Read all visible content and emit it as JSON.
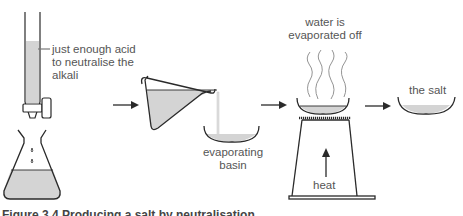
{
  "diagram": {
    "labels": {
      "burette": "just enough acid\nto neutralise the\nalkali",
      "burette_line1": "just enough acid",
      "burette_line2": "to neutralise the",
      "burette_line3": "alkali",
      "basin_line1": "evaporating",
      "basin_line2": "basin",
      "evap_line1": "water is",
      "evap_line2": "evaporated off",
      "heat": "heat",
      "salt": "the salt"
    },
    "caption": "Figure 3.4  Producing a salt by neutralisation",
    "colors": {
      "stroke": "#2a2a2a",
      "liquid": "#d4d4d4",
      "text": "#555555"
    },
    "steps": [
      "titration",
      "pour into evaporating basin",
      "heat to evaporate water",
      "salt remains"
    ]
  }
}
